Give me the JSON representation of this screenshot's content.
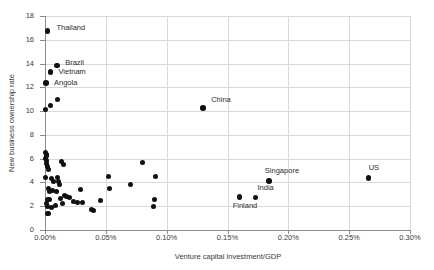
{
  "chart_data": {
    "type": "scatter",
    "title": "",
    "xlabel": "Venture capital investment/GDP",
    "ylabel": "New business ownership rate",
    "xlim": [
      0.0,
      0.3
    ],
    "ylim": [
      0,
      18
    ],
    "xtick_labels": [
      "0.00%",
      "0.05%",
      "0.10%",
      "0.15%",
      "0.20%",
      "0.25%",
      "0.30%"
    ],
    "xtick_values": [
      0.0,
      0.05,
      0.1,
      0.15,
      0.2,
      0.25,
      0.3
    ],
    "ytick_labels": [
      "0",
      "2",
      "4",
      "6",
      "8",
      "10",
      "12",
      "14",
      "16",
      "18"
    ],
    "ytick_values": [
      0,
      2,
      4,
      6,
      8,
      10,
      12,
      14,
      16,
      18
    ],
    "grid": true,
    "legend": null,
    "marker_color": "#111111",
    "gridline_color": "#d9d9d9",
    "axis_color": "#8c8c8c",
    "labeled_points": [
      {
        "name": "Thailand",
        "x": 0.002,
        "y": 16.75,
        "label_dx": 9,
        "label_dy": -3
      },
      {
        "name": "Brazil",
        "x": 0.01,
        "y": 13.85,
        "label_dx": 8,
        "label_dy": -2
      },
      {
        "name": "Vietnam",
        "x": 0.0045,
        "y": 13.3,
        "label_dx": 8,
        "label_dy": 0
      },
      {
        "name": "Angola",
        "x": 0.0008,
        "y": 12.35,
        "label_dx": 8,
        "label_dy": 0
      },
      {
        "name": "China",
        "x": 0.13,
        "y": 10.25,
        "label_dx": 8,
        "label_dy": -8
      },
      {
        "name": "Singapore",
        "x": 0.184,
        "y": 4.1,
        "label_dx": -4,
        "label_dy": -10
      },
      {
        "name": "US",
        "x": 0.266,
        "y": 4.35,
        "label_dx": 0,
        "label_dy": -10
      },
      {
        "name": "India",
        "x": 0.173,
        "y": 2.75,
        "label_dx": 2,
        "label_dy": -9
      },
      {
        "name": "Finland",
        "x": 0.16,
        "y": 2.8,
        "label_dx": -7,
        "label_dy": 9
      }
    ],
    "unlabeled_points": [
      {
        "x": 0.0004,
        "y": 10.1
      },
      {
        "x": 0.0048,
        "y": 10.45
      },
      {
        "x": 0.0105,
        "y": 10.95
      },
      {
        "x": 0.0003,
        "y": 6.55
      },
      {
        "x": 0.001,
        "y": 6.35
      },
      {
        "x": 0.0012,
        "y": 6.25
      },
      {
        "x": 0.0016,
        "y": 6.3
      },
      {
        "x": 0.0006,
        "y": 6.05
      },
      {
        "x": 0.0009,
        "y": 5.85
      },
      {
        "x": 0.0014,
        "y": 5.6
      },
      {
        "x": 0.0021,
        "y": 5.35
      },
      {
        "x": 0.0026,
        "y": 5.05
      },
      {
        "x": 0.0002,
        "y": 4.4
      },
      {
        "x": 0.0135,
        "y": 5.75
      },
      {
        "x": 0.015,
        "y": 5.5
      },
      {
        "x": 0.052,
        "y": 4.5
      },
      {
        "x": 0.08,
        "y": 5.65
      },
      {
        "x": 0.0905,
        "y": 4.5
      },
      {
        "x": 0.07,
        "y": 3.85
      },
      {
        "x": 0.053,
        "y": 3.45
      },
      {
        "x": 0.029,
        "y": 3.4
      },
      {
        "x": 0.0105,
        "y": 4.4
      },
      {
        "x": 0.0112,
        "y": 4.1
      },
      {
        "x": 0.0118,
        "y": 3.8
      },
      {
        "x": 0.0095,
        "y": 3.2
      },
      {
        "x": 0.006,
        "y": 3.3
      },
      {
        "x": 0.003,
        "y": 3.45
      },
      {
        "x": 0.0035,
        "y": 3.25
      },
      {
        "x": 0.004,
        "y": 2.6
      },
      {
        "x": 0.002,
        "y": 2.55
      },
      {
        "x": 0.0013,
        "y": 2.2
      },
      {
        "x": 0.0017,
        "y": 1.95
      },
      {
        "x": 0.0024,
        "y": 1.4
      },
      {
        "x": 0.0028,
        "y": 1.35
      },
      {
        "x": 0.0055,
        "y": 1.9
      },
      {
        "x": 0.009,
        "y": 2.1
      },
      {
        "x": 0.0125,
        "y": 2.65
      },
      {
        "x": 0.014,
        "y": 2.25
      },
      {
        "x": 0.016,
        "y": 2.9
      },
      {
        "x": 0.0175,
        "y": 2.8
      },
      {
        "x": 0.02,
        "y": 2.7
      },
      {
        "x": 0.0235,
        "y": 2.4
      },
      {
        "x": 0.0265,
        "y": 2.35
      },
      {
        "x": 0.031,
        "y": 2.3
      },
      {
        "x": 0.038,
        "y": 1.7
      },
      {
        "x": 0.0395,
        "y": 1.6
      },
      {
        "x": 0.0455,
        "y": 2.45
      },
      {
        "x": 0.09,
        "y": 2.55
      },
      {
        "x": 0.0895,
        "y": 1.95
      },
      {
        "x": 0.007,
        "y": 4.05
      },
      {
        "x": 0.005,
        "y": 4.35
      }
    ]
  }
}
